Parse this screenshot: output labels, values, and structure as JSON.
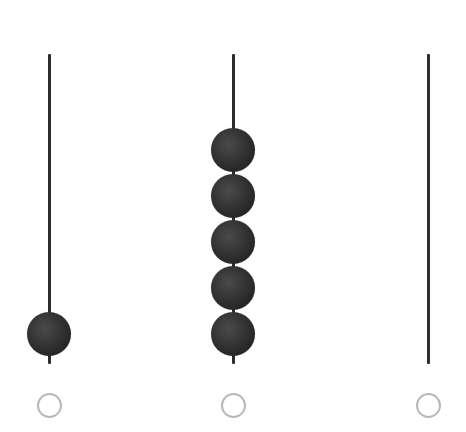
{
  "abacus": {
    "rods": [
      {
        "label": "hundreds",
        "beads": 1
      },
      {
        "label": "tens",
        "beads": 5
      },
      {
        "label": "ones",
        "beads": 0
      }
    ],
    "colors": {
      "rod": "#2e2e2e",
      "bead": "#333333",
      "ring": "#b8b8b8"
    }
  }
}
